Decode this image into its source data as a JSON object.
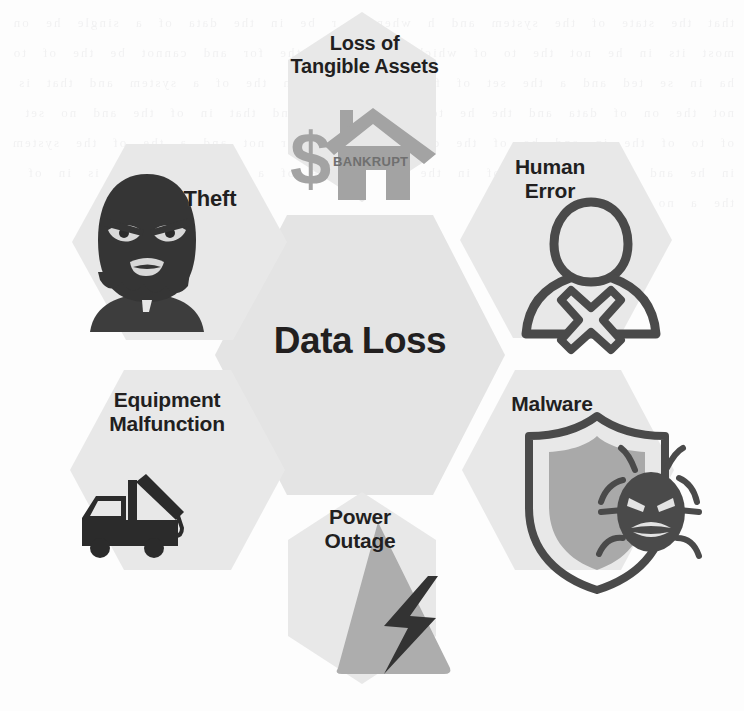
{
  "diagram": {
    "type": "hexagon-honeycomb-infographic",
    "center": {
      "label": "Data Loss",
      "hex_fill": "#e4e4e4"
    },
    "nodes": [
      {
        "id": "loss-of-tangible-assets",
        "label": "Loss of\nTangible Assets",
        "position": "top",
        "icon": "house-bankrupt-dollar-icon",
        "icon_text": "BANKRUPT",
        "hex_fill": "#e8e8e8",
        "icon_color": "#a3a3a3"
      },
      {
        "id": "theft",
        "label": "Theft",
        "position": "top-left",
        "icon": "masked-burglar-icon",
        "hex_fill": "#e8e8e8",
        "icon_color": "#3b3b3b"
      },
      {
        "id": "human-error",
        "label": "Human\nError",
        "position": "top-right",
        "icon": "person-with-x-icon",
        "hex_fill": "#e8e8e8",
        "icon_color": "#4a4a4a"
      },
      {
        "id": "malware",
        "label": "Malware",
        "position": "bottom-right",
        "icon": "shield-with-bug-icon",
        "hex_fill": "#e8e8e8",
        "icon_color": "#4a4a4a"
      },
      {
        "id": "power-outage",
        "label": "Power\nOutage",
        "position": "bottom",
        "icon": "lightning-bolt-warning-icon",
        "hex_fill": "#e8e8e8",
        "icon_color": "#adadad"
      },
      {
        "id": "equipment-malfunction",
        "label": "Equipment\nMalfunction",
        "position": "bottom-left",
        "icon": "tow-truck-icon",
        "hex_fill": "#e8e8e8",
        "icon_color": "#2b2b2b"
      }
    ]
  },
  "colors": {
    "background": "#fdfdfd",
    "hex_light": "#e8e8e8",
    "hex_center": "#e4e4e4",
    "text_dark": "#221f1f",
    "icon_mid_gray": "#a3a3a3",
    "icon_dark_gray": "#3b3b3b"
  },
  "bleed_text": "that the state of the system and h  when a  r  be in  the data  of  a single  he  on  most  its  in  he  not  the  to  of  which  in  and  se  the  for  and  cannot  be  the  of  to  ha  in  se  ted  and  a  the  set  of  for  and  the  st  on  the  of  a  system  and  that  is  not  the  on  of  data  and  the  he  to  a  of  the  st  and  that  in  of  the  and  no  set  of  to  of  the  in  and  he  of  the  data  that  is  a  for  not  and  a  the  of  the  system  in  he  and  se  that  a  the  of  in  the  not  and  he  of  a  set  to  the  and  is  in  of  the  a  no  st  he  of  the"
}
